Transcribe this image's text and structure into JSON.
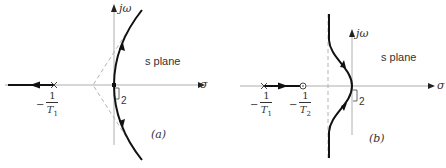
{
  "panels": [
    {
      "id": "a",
      "caption": "(a)",
      "plane_label": "s plane",
      "axis_x_label": "σ",
      "axis_y_label": "jω",
      "multiplicity_label": "2",
      "pole_label": {
        "sign": "−",
        "num": "1",
        "den": "T",
        "sub": "1"
      }
    },
    {
      "id": "b",
      "caption": "(b)",
      "plane_label": "s plane",
      "axis_x_label": "σ",
      "axis_y_label": "jω",
      "multiplicity_label": "2",
      "pole_label": {
        "sign": "−",
        "num": "1",
        "den": "T",
        "sub": "1"
      },
      "zero_label": {
        "sign": "−",
        "num": "1",
        "den": "T",
        "sub": "2"
      }
    }
  ],
  "colors": {
    "locus": "#111111",
    "axis": "#888888",
    "asymptote": "#aaaaaa"
  }
}
